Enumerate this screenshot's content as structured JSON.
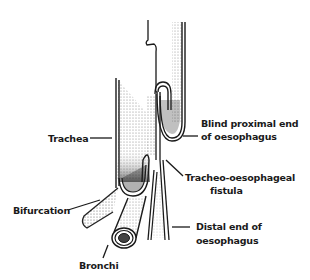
{
  "diagram": {
    "colors": {
      "ink": "#1a1a1a",
      "shade": "#8a8a8a",
      "background": "#ffffff"
    },
    "labels": {
      "trachea": "Trachea",
      "blind_proximal_line1": "Blind proximal end",
      "blind_proximal_line2": "of oesophagus",
      "fistula_line1": "Tracheo-oesophageal",
      "fistula_line2": "fistula",
      "bifurcation": "Bifurcation",
      "distal_line1": "Distal end of",
      "distal_line2": "oesophagus",
      "bronchi": "Bronchi"
    }
  }
}
